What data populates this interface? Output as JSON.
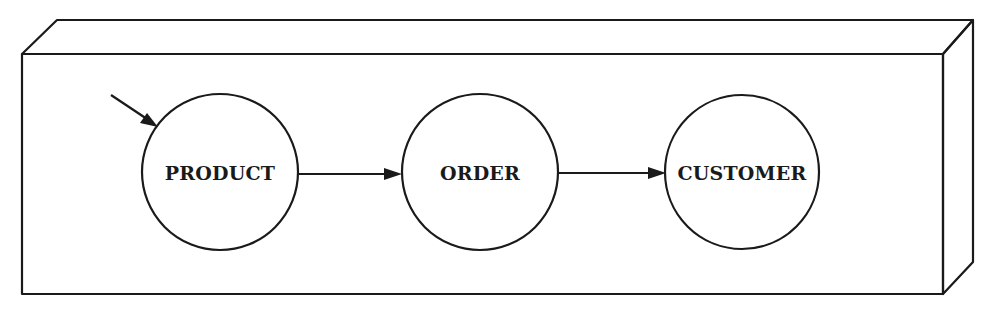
{
  "diagram": {
    "type": "data-flow",
    "container": {
      "shape": "3d-box",
      "front_face": {
        "x": 22,
        "y": 54,
        "width": 921,
        "height": 240
      },
      "depth_offset": {
        "dx": 30,
        "dy": -34
      }
    },
    "nodes": [
      {
        "id": "product",
        "label": "PRODUCT",
        "cx": 220,
        "cy": 172,
        "r": 78
      },
      {
        "id": "order",
        "label": "ORDER",
        "cx": 480,
        "cy": 172,
        "r": 78
      },
      {
        "id": "customer",
        "label": "CUSTOMER",
        "cx": 742,
        "cy": 172,
        "r": 77
      }
    ],
    "edges": [
      {
        "from": "external",
        "to": "product",
        "label": ""
      },
      {
        "from": "product",
        "to": "order",
        "label": ""
      },
      {
        "from": "order",
        "to": "customer",
        "label": ""
      }
    ],
    "colors": {
      "stroke": "#1a1a1a",
      "background": "#ffffff"
    }
  }
}
